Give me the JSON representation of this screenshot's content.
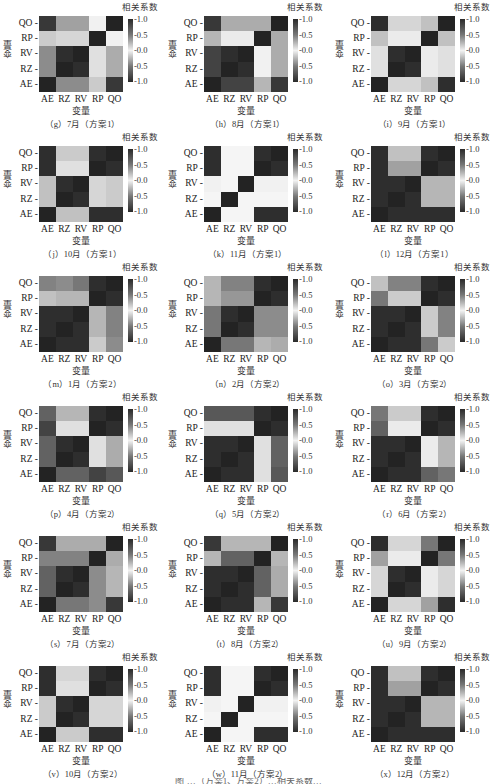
{
  "chart_data": {
    "type": "heatmap",
    "title": "",
    "colorbar_title": "相关系数",
    "colorbar_ticks": [
      "1.0",
      "0.5",
      "0.0",
      "-0.5",
      "-1.0"
    ],
    "colorbar_range": [
      -1.0,
      1.0
    ],
    "xlabel": "变量",
    "ylabel": "变量",
    "x_categories": [
      "AE",
      "RZ",
      "RV",
      "RP",
      "QO"
    ],
    "y_categories_top_to_bottom": [
      "QO",
      "RP",
      "RV",
      "RZ",
      "AE"
    ],
    "note": "Values approximated from grayscale intensity (diverging colormap: dark at ±1, light at 0); signs not recoverable, magnitudes shown.",
    "panels": [
      {
        "caption": "（g）7月（方案1）",
        "matrix": [
          [
            0.9,
            0.4,
            0.4,
            0.02,
            1.0
          ],
          [
            0.2,
            0.15,
            0.15,
            1.0,
            0.02
          ],
          [
            0.5,
            0.95,
            1.0,
            0.1,
            0.35
          ],
          [
            0.5,
            1.0,
            0.95,
            0.1,
            0.35
          ],
          [
            1.0,
            0.5,
            0.5,
            0.2,
            0.9
          ]
        ]
      },
      {
        "caption": "（h）8月（方案1）",
        "matrix": [
          [
            0.9,
            0.35,
            0.35,
            0.35,
            1.0
          ],
          [
            0.3,
            0.05,
            0.05,
            1.0,
            0.35
          ],
          [
            0.85,
            0.95,
            1.0,
            0.02,
            0.35
          ],
          [
            0.85,
            1.0,
            0.95,
            0.02,
            0.35
          ],
          [
            1.0,
            0.85,
            0.85,
            0.3,
            0.9
          ]
        ]
      },
      {
        "caption": "（i）9月（方案1）",
        "matrix": [
          [
            0.95,
            0.15,
            0.15,
            0.25,
            1.0
          ],
          [
            0.25,
            0.05,
            0.05,
            1.0,
            0.25
          ],
          [
            0.1,
            0.95,
            1.0,
            0.05,
            0.1
          ],
          [
            0.1,
            1.0,
            0.95,
            0.05,
            0.1
          ],
          [
            1.0,
            0.15,
            0.15,
            0.25,
            0.95
          ]
        ]
      },
      {
        "caption": "（j）10月（方案1）",
        "matrix": [
          [
            0.95,
            0.2,
            0.2,
            0.95,
            1.0
          ],
          [
            0.95,
            0.1,
            0.1,
            1.0,
            0.95
          ],
          [
            0.25,
            0.95,
            1.0,
            0.15,
            0.2
          ],
          [
            0.25,
            1.0,
            0.95,
            0.15,
            0.2
          ],
          [
            1.0,
            0.25,
            0.25,
            0.95,
            0.95
          ]
        ]
      },
      {
        "caption": "（k）11月（方案1）",
        "matrix": [
          [
            0.95,
            0.0,
            0.0,
            0.95,
            1.0
          ],
          [
            0.95,
            0.0,
            0.0,
            1.0,
            0.95
          ],
          [
            0.02,
            0.0,
            1.0,
            0.02,
            0.02
          ],
          [
            0.0,
            1.0,
            0.0,
            0.0,
            0.0
          ],
          [
            1.0,
            0.0,
            0.0,
            0.95,
            0.95
          ]
        ]
      },
      {
        "caption": "（l）12月（方案1）",
        "matrix": [
          [
            0.95,
            0.25,
            0.25,
            0.95,
            1.0
          ],
          [
            0.95,
            0.4,
            0.4,
            1.0,
            0.95
          ],
          [
            0.95,
            0.95,
            1.0,
            0.3,
            0.3
          ],
          [
            0.95,
            1.0,
            0.95,
            0.3,
            0.3
          ],
          [
            1.0,
            0.95,
            0.95,
            0.95,
            0.95
          ]
        ]
      },
      {
        "caption": "（m）1月（方案2）",
        "matrix": [
          [
            0.55,
            0.5,
            0.6,
            0.95,
            1.0
          ],
          [
            0.25,
            0.3,
            0.3,
            1.0,
            0.95
          ],
          [
            0.95,
            0.95,
            1.0,
            0.3,
            0.55
          ],
          [
            0.95,
            1.0,
            0.95,
            0.3,
            0.55
          ],
          [
            1.0,
            0.95,
            0.95,
            0.2,
            0.5
          ]
        ]
      },
      {
        "caption": "（n）2月（方案2）",
        "matrix": [
          [
            0.3,
            0.55,
            0.55,
            0.95,
            1.0
          ],
          [
            0.3,
            0.45,
            0.45,
            1.0,
            0.95
          ],
          [
            0.6,
            0.95,
            1.0,
            0.5,
            0.5
          ],
          [
            0.6,
            1.0,
            0.95,
            0.5,
            0.5
          ],
          [
            1.0,
            0.6,
            0.6,
            0.3,
            0.35
          ]
        ]
      },
      {
        "caption": "（o）3月（方案2）",
        "matrix": [
          [
            0.25,
            0.55,
            0.55,
            0.95,
            1.0
          ],
          [
            0.6,
            0.2,
            0.2,
            1.0,
            0.95
          ],
          [
            0.95,
            0.95,
            1.0,
            0.2,
            0.55
          ],
          [
            0.95,
            1.0,
            0.95,
            0.2,
            0.55
          ],
          [
            1.0,
            0.95,
            0.95,
            0.6,
            0.2
          ]
        ]
      },
      {
        "caption": "（p）4月（方案2）",
        "matrix": [
          [
            0.7,
            0.3,
            0.3,
            0.95,
            1.0
          ],
          [
            0.85,
            0.1,
            0.1,
            1.0,
            0.95
          ],
          [
            0.7,
            0.95,
            1.0,
            0.1,
            0.35
          ],
          [
            0.7,
            1.0,
            0.95,
            0.1,
            0.35
          ],
          [
            1.0,
            0.7,
            0.7,
            0.85,
            0.75
          ]
        ]
      },
      {
        "caption": "（q）5月（方案2）",
        "matrix": [
          [
            0.75,
            0.75,
            0.75,
            0.95,
            1.0
          ],
          [
            0.1,
            0.1,
            0.1,
            1.0,
            0.95
          ],
          [
            0.95,
            0.95,
            1.0,
            0.1,
            0.7
          ],
          [
            0.95,
            1.0,
            0.95,
            0.1,
            0.7
          ],
          [
            1.0,
            0.95,
            0.95,
            0.1,
            0.75
          ]
        ]
      },
      {
        "caption": "（r）6月（方案2）",
        "matrix": [
          [
            0.6,
            0.2,
            0.2,
            0.95,
            1.0
          ],
          [
            0.7,
            0.05,
            0.05,
            1.0,
            0.95
          ],
          [
            0.95,
            0.95,
            1.0,
            0.05,
            0.3
          ],
          [
            0.95,
            1.0,
            0.95,
            0.05,
            0.3
          ],
          [
            1.0,
            0.95,
            0.95,
            0.7,
            0.6
          ]
        ]
      },
      {
        "caption": "（s）7月（方案2）",
        "matrix": [
          [
            0.9,
            0.35,
            0.35,
            0.35,
            1.0
          ],
          [
            0.55,
            0.55,
            0.55,
            1.0,
            0.35
          ],
          [
            0.7,
            0.95,
            1.0,
            0.5,
            0.3
          ],
          [
            0.7,
            1.0,
            0.95,
            0.5,
            0.3
          ],
          [
            1.0,
            0.6,
            0.6,
            0.5,
            0.9
          ]
        ]
      },
      {
        "caption": "（t）8月（方案2）",
        "matrix": [
          [
            0.9,
            0.3,
            0.3,
            0.3,
            1.0
          ],
          [
            0.3,
            0.7,
            0.7,
            1.0,
            0.3
          ],
          [
            0.95,
            0.95,
            1.0,
            0.7,
            0.35
          ],
          [
            0.95,
            1.0,
            0.95,
            0.7,
            0.35
          ],
          [
            1.0,
            0.95,
            0.95,
            0.3,
            0.9
          ]
        ]
      },
      {
        "caption": "（u）9月（方案2）",
        "matrix": [
          [
            0.95,
            0.15,
            0.15,
            0.6,
            1.0
          ],
          [
            0.4,
            0.05,
            0.05,
            1.0,
            0.6
          ],
          [
            0.15,
            0.95,
            1.0,
            0.05,
            0.15
          ],
          [
            0.15,
            1.0,
            0.95,
            0.05,
            0.15
          ],
          [
            1.0,
            0.15,
            0.15,
            0.4,
            0.95
          ]
        ]
      },
      {
        "caption": "（v）10月（方案2）",
        "matrix": [
          [
            0.95,
            0.15,
            0.15,
            0.95,
            1.0
          ],
          [
            0.95,
            0.1,
            0.1,
            1.0,
            0.95
          ],
          [
            0.2,
            0.95,
            1.0,
            0.15,
            0.15
          ],
          [
            0.2,
            1.0,
            0.95,
            0.15,
            0.15
          ],
          [
            1.0,
            0.2,
            0.2,
            0.95,
            0.95
          ]
        ]
      },
      {
        "caption": "（w）11月（方案2）",
        "matrix": [
          [
            0.95,
            0.0,
            0.0,
            0.95,
            1.0
          ],
          [
            0.95,
            0.0,
            0.0,
            1.0,
            0.95
          ],
          [
            0.02,
            0.0,
            1.0,
            0.02,
            0.02
          ],
          [
            0.0,
            1.0,
            0.0,
            0.0,
            0.0
          ],
          [
            1.0,
            0.0,
            0.0,
            0.95,
            0.95
          ]
        ]
      },
      {
        "caption": "（x）12月（方案2）",
        "matrix": [
          [
            0.95,
            0.25,
            0.25,
            0.95,
            1.0
          ],
          [
            0.95,
            0.4,
            0.4,
            1.0,
            0.95
          ],
          [
            0.95,
            0.95,
            1.0,
            0.3,
            0.3
          ],
          [
            0.95,
            1.0,
            0.95,
            0.3,
            0.3
          ],
          [
            1.0,
            0.95,
            0.95,
            0.95,
            0.95
          ]
        ]
      }
    ]
  },
  "footer_partial": "图 …（方案1、方案2）…相关系数…"
}
